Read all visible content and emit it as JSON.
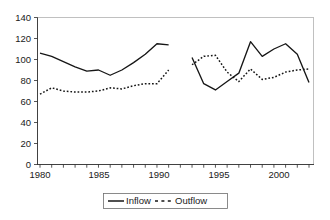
{
  "chart_data": {
    "type": "line",
    "title": "",
    "subtitle": "",
    "xlabel": "",
    "ylabel": "",
    "xlim": [
      1980,
      2003
    ],
    "ylim": [
      0,
      140
    ],
    "grid": false,
    "legend_position": "bottom-center",
    "y_ticks": [
      0,
      20,
      40,
      60,
      80,
      100,
      120,
      140
    ],
    "y_tick_labels": [
      "0",
      "20",
      "40",
      "60",
      "80",
      "100",
      "120",
      "140"
    ],
    "x_ticks": [
      1980,
      1985,
      1990,
      1995,
      2000
    ],
    "x_tick_labels": [
      "1980",
      "1985",
      "1990",
      "1995",
      "2000"
    ],
    "x_minor_ticks": [
      1980,
      1981,
      1982,
      1983,
      1984,
      1985,
      1986,
      1987,
      1988,
      1989,
      1990,
      1991,
      1992,
      1993,
      1994,
      1995,
      1996,
      1997,
      1998,
      1999,
      2000,
      2001,
      2002,
      2003
    ],
    "annotations": [
      "data gap between 1991 and 1993"
    ],
    "series": [
      {
        "name": "Inflow",
        "style": "solid",
        "color": "#161616",
        "segments": [
          {
            "x": [
              1980,
              1981,
              1982,
              1983,
              1984,
              1985,
              1986,
              1987,
              1988,
              1989,
              1990,
              1991
            ],
            "values": [
              106,
              103,
              98,
              93,
              89,
              90,
              85,
              90,
              97,
              105,
              115,
              114
            ]
          },
          {
            "x": [
              1993,
              1994,
              1995,
              1996,
              1997,
              1998,
              1999,
              2000,
              2001,
              2002,
              2003
            ],
            "values": [
              102,
              77,
              71,
              79,
              87,
              117,
              103,
              110,
              115,
              105,
              78
            ]
          }
        ]
      },
      {
        "name": "Outflow",
        "style": "dashed",
        "color": "#161616",
        "segments": [
          {
            "x": [
              1980,
              1981,
              1982,
              1983,
              1984,
              1985,
              1986,
              1987,
              1988,
              1989,
              1990,
              1991
            ],
            "values": [
              67,
              73,
              70,
              69,
              69,
              70,
              73,
              72,
              75,
              77,
              77,
              90
            ]
          },
          {
            "x": [
              1993,
              1994,
              1995,
              1996,
              1997,
              1998,
              1999,
              2000,
              2001,
              2002,
              2003
            ],
            "values": [
              95,
              103,
              104,
              88,
              79,
              91,
              81,
              83,
              88,
              90,
              91
            ]
          }
        ]
      }
    ]
  },
  "legend": {
    "items": [
      {
        "label": "Inflow",
        "marker": "solid-line-swatch"
      },
      {
        "label": "Outflow",
        "marker": "dashed-line-swatch"
      }
    ]
  }
}
